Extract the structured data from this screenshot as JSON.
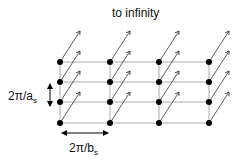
{
  "title": "to infinity",
  "label_vertical": {
    "main": "2π/a",
    "sub": "s"
  },
  "label_horizontal": {
    "main": "2π/b",
    "sub": "s"
  },
  "grid": {
    "columns_x": [
      60,
      110,
      159,
      209
    ],
    "rows_y": [
      62,
      82,
      102,
      123
    ],
    "arrow_dx": 20,
    "arrow_dy": -31
  },
  "colors": {
    "dot": "#000000",
    "line": "#aaaaaa",
    "arrow": "#333333",
    "text": "#111111"
  }
}
